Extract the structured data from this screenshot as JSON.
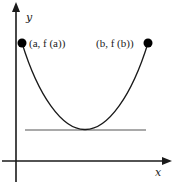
{
  "diagram": {
    "type": "rolle-theorem-illustration",
    "axes": {
      "x_label": "x",
      "y_label": "y"
    },
    "points": [
      {
        "id": "a",
        "label": "(a, f (a))"
      },
      {
        "id": "b",
        "label": "(b, f (b))"
      }
    ],
    "curve": "parabola-like U shape from (a, f(a)) down to a minimum and back up to (b, f(b))",
    "tangent": "horizontal tangent line at the minimum",
    "colors": {
      "stroke": "#1a1a1a",
      "tangent": "#555555",
      "background": "#ffffff"
    }
  }
}
